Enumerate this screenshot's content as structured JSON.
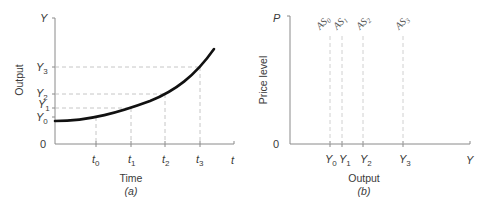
{
  "panel_a": {
    "caption": "(a)",
    "x_axis_title": "Time",
    "y_axis_title": "Output",
    "y_axis_end_label": "Y",
    "x_axis_end_label": "t",
    "origin_label": "0",
    "x_ticks": [
      {
        "base": "t",
        "sub": "0"
      },
      {
        "base": "t",
        "sub": "1"
      },
      {
        "base": "t",
        "sub": "2"
      },
      {
        "base": "t",
        "sub": "3"
      }
    ],
    "y_ticks": [
      {
        "base": "Y",
        "sub": "0"
      },
      {
        "base": "Y",
        "sub": "1"
      },
      {
        "base": "Y",
        "sub": "2"
      },
      {
        "base": "Y",
        "sub": "3"
      }
    ],
    "curve": "exponential growth of output over time"
  },
  "panel_b": {
    "caption": "(b)",
    "x_axis_title": "Output",
    "y_axis_title": "Price level",
    "y_axis_end_label": "P",
    "x_axis_end_label": "Y",
    "origin_label": "0",
    "x_ticks": [
      {
        "base": "Y",
        "sub": "0"
      },
      {
        "base": "Y",
        "sub": "1"
      },
      {
        "base": "Y",
        "sub": "2"
      },
      {
        "base": "Y",
        "sub": "3"
      }
    ],
    "curves": [
      {
        "base": "AS",
        "sub": "0"
      },
      {
        "base": "AS",
        "sub": "1"
      },
      {
        "base": "AS",
        "sub": "2"
      },
      {
        "base": "AS",
        "sub": "3"
      }
    ]
  }
}
